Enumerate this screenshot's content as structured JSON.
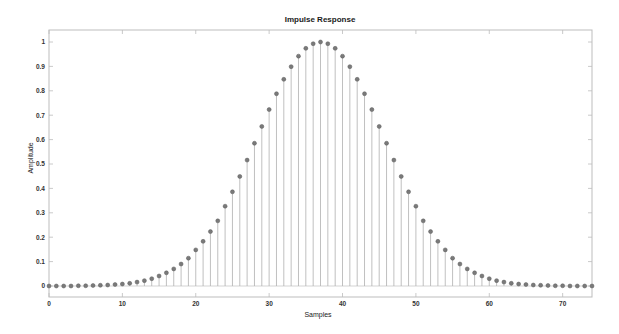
{
  "chart_data": {
    "type": "stem",
    "title": "Impulse Response",
    "xlabel": "Samples",
    "ylabel": "Amplitude",
    "xlim": [
      0,
      74
    ],
    "ylim": [
      -0.03,
      1.05
    ],
    "xticks": [
      0,
      10,
      20,
      30,
      40,
      50,
      60,
      70
    ],
    "yticks": [
      0,
      0.1,
      0.2,
      0.3,
      0.4,
      0.5,
      0.6,
      0.7,
      0.8,
      0.9,
      1
    ],
    "ytick_labels": [
      "0",
      "0.1",
      "0.2",
      "0.3",
      "0.4",
      "0.5",
      "0.6",
      "0.7",
      "0.8",
      "0.9",
      "1"
    ],
    "grid": false,
    "legend": null,
    "series": [
      {
        "name": "Impulse Response",
        "x": [
          0,
          1,
          2,
          3,
          4,
          5,
          6,
          7,
          8,
          9,
          10,
          11,
          12,
          13,
          14,
          15,
          16,
          17,
          18,
          19,
          20,
          21,
          22,
          23,
          24,
          25,
          26,
          27,
          28,
          29,
          30,
          31,
          32,
          33,
          34,
          35,
          36,
          37,
          38,
          39,
          40,
          41,
          42,
          43,
          44,
          45,
          46,
          47,
          48,
          49,
          50,
          51,
          52,
          53,
          54,
          55,
          56,
          57,
          58,
          59,
          60,
          61,
          62,
          63,
          64,
          65,
          66,
          67,
          68,
          69,
          70,
          71,
          72,
          73,
          74
        ],
        "values": [
          0.0,
          0.0,
          0.0,
          0.0,
          0.001,
          0.001,
          0.002,
          0.003,
          0.004,
          0.006,
          0.008,
          0.011,
          0.016,
          0.022,
          0.03,
          0.041,
          0.054,
          0.07,
          0.09,
          0.114,
          0.148,
          0.183,
          0.223,
          0.267,
          0.327,
          0.386,
          0.449,
          0.516,
          0.585,
          0.654,
          0.723,
          0.788,
          0.847,
          0.899,
          0.942,
          0.974,
          0.993,
          1.0,
          0.993,
          0.974,
          0.942,
          0.899,
          0.847,
          0.788,
          0.723,
          0.654,
          0.585,
          0.516,
          0.449,
          0.386,
          0.327,
          0.267,
          0.223,
          0.183,
          0.148,
          0.114,
          0.09,
          0.07,
          0.054,
          0.041,
          0.03,
          0.022,
          0.016,
          0.011,
          0.008,
          0.006,
          0.004,
          0.003,
          0.002,
          0.001,
          0.001,
          0.0,
          0.0,
          0.0,
          0.0
        ]
      }
    ],
    "style": {
      "stem_color": "#b0b0b0",
      "marker_color": "#7a7a7a",
      "marker_edge": "#5a5a5a",
      "axes_color": "#bdbdbd",
      "baseline_color": "#c8c8c8"
    }
  }
}
